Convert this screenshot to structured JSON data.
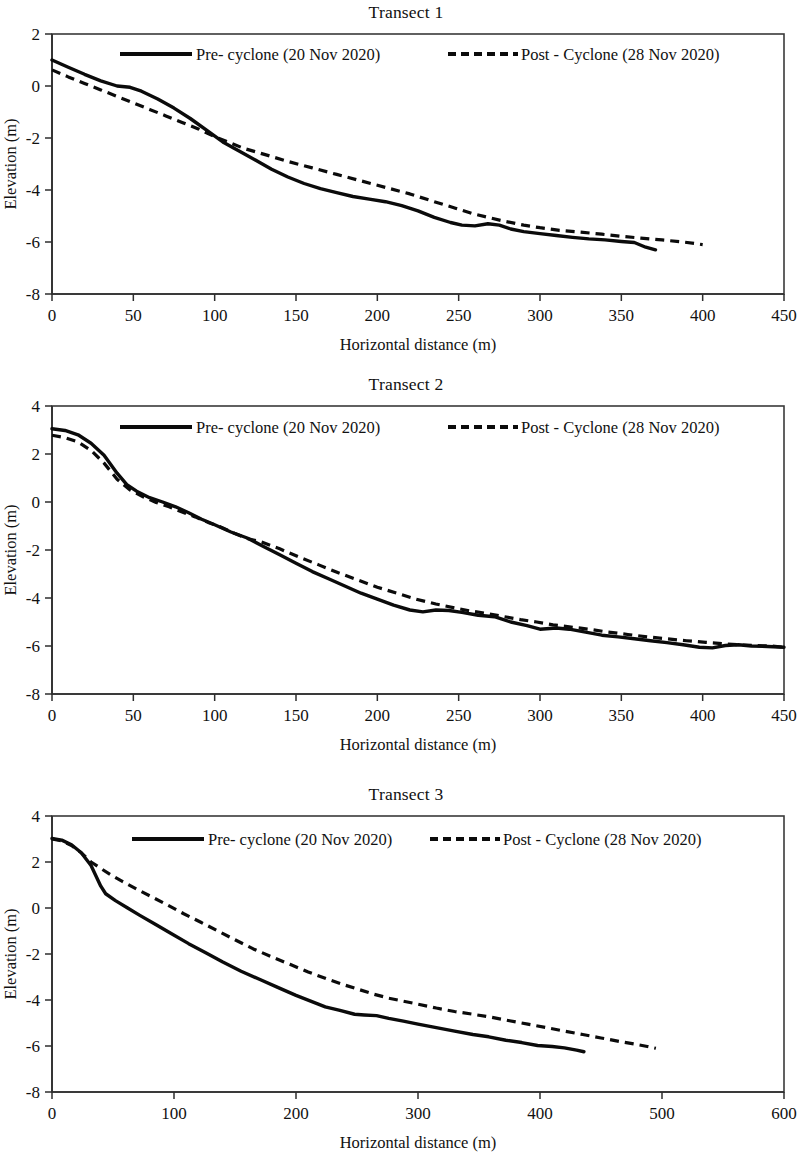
{
  "figure": {
    "panels": [
      "transect_1",
      "transect_2",
      "transect_3"
    ]
  },
  "legend": {
    "pre_label": "Pre- cyclone (20 Nov 2020)",
    "post_label": "Post - Cyclone (28 Nov 2020)"
  },
  "axis": {
    "xlabel": "Horizontal distance (m)",
    "ylabel": "Elevation (m)"
  },
  "titles": {
    "t1": "Transect 1",
    "t2": "Transect 2",
    "t3": "Transect 3"
  },
  "chart_data": [
    {
      "id": "transect_1",
      "type": "line",
      "title": "Transect 1",
      "xlabel": "Horizontal distance (m)",
      "ylabel": "Elevation (m)",
      "xlim": [
        0,
        450
      ],
      "ylim": [
        -8,
        2
      ],
      "xticks": [
        0,
        50,
        100,
        150,
        200,
        250,
        300,
        350,
        400,
        450
      ],
      "yticks": [
        2,
        0,
        -2,
        -4,
        -6,
        -8
      ],
      "grid": false,
      "legend_position": "top-inside",
      "series": [
        {
          "name": "Pre- cyclone (20 Nov 2020)",
          "style": "solid",
          "color": "#0b0b0b",
          "x": [
            0,
            10,
            20,
            30,
            40,
            48,
            55,
            65,
            75,
            85,
            95,
            105,
            115,
            125,
            135,
            145,
            155,
            165,
            175,
            185,
            195,
            205,
            215,
            225,
            235,
            245,
            252,
            260,
            268,
            275,
            282,
            290,
            300,
            310,
            320,
            330,
            340,
            350,
            358,
            365,
            371
          ],
          "y": [
            1.0,
            0.72,
            0.45,
            0.2,
            0.0,
            -0.05,
            -0.2,
            -0.5,
            -0.85,
            -1.25,
            -1.7,
            -2.15,
            -2.5,
            -2.85,
            -3.2,
            -3.5,
            -3.75,
            -3.95,
            -4.1,
            -4.25,
            -4.35,
            -4.45,
            -4.6,
            -4.8,
            -5.05,
            -5.25,
            -5.35,
            -5.38,
            -5.3,
            -5.35,
            -5.5,
            -5.6,
            -5.68,
            -5.75,
            -5.82,
            -5.88,
            -5.92,
            -5.98,
            -6.02,
            -6.2,
            -6.3
          ]
        },
        {
          "name": "Post - Cyclone (28 Nov 2020)",
          "style": "dashed",
          "color": "#0b0b0b",
          "x": [
            0,
            10,
            20,
            30,
            40,
            50,
            60,
            70,
            80,
            90,
            100,
            110,
            118,
            130,
            145,
            160,
            175,
            190,
            205,
            220,
            235,
            248,
            258,
            268,
            278,
            290,
            300,
            312,
            325,
            338,
            350,
            362,
            375,
            388,
            400
          ],
          "y": [
            0.62,
            0.35,
            0.1,
            -0.15,
            -0.4,
            -0.65,
            -0.9,
            -1.15,
            -1.4,
            -1.65,
            -1.95,
            -2.2,
            -2.4,
            -2.62,
            -2.9,
            -3.15,
            -3.4,
            -3.65,
            -3.9,
            -4.15,
            -4.45,
            -4.7,
            -4.9,
            -5.05,
            -5.2,
            -5.35,
            -5.45,
            -5.55,
            -5.62,
            -5.7,
            -5.78,
            -5.85,
            -5.92,
            -6.0,
            -6.1
          ]
        }
      ]
    },
    {
      "id": "transect_2",
      "type": "line",
      "title": "Transect 2",
      "xlabel": "Horizontal distance (m)",
      "ylabel": "Elevation (m)",
      "xlim": [
        0,
        450
      ],
      "ylim": [
        -8,
        4
      ],
      "xticks": [
        0,
        50,
        100,
        150,
        200,
        250,
        300,
        350,
        400,
        450
      ],
      "yticks": [
        4,
        2,
        0,
        -2,
        -4,
        -6,
        -8
      ],
      "grid": false,
      "legend_position": "top-inside",
      "series": [
        {
          "name": "Pre- cyclone (20 Nov 2020)",
          "style": "solid",
          "color": "#0b0b0b",
          "x": [
            0,
            8,
            16,
            24,
            32,
            40,
            46,
            52,
            60,
            68,
            76,
            84,
            92,
            100,
            110,
            120,
            130,
            140,
            150,
            160,
            170,
            180,
            190,
            200,
            210,
            220,
            228,
            236,
            244,
            252,
            262,
            272,
            282,
            292,
            300,
            310,
            318,
            328,
            338,
            348,
            358,
            368,
            378,
            388,
            398,
            406,
            414,
            422,
            430,
            440,
            450
          ],
          "y": [
            3.05,
            2.98,
            2.8,
            2.45,
            1.95,
            1.2,
            0.72,
            0.45,
            0.18,
            0.0,
            -0.2,
            -0.45,
            -0.72,
            -0.95,
            -1.25,
            -1.5,
            -1.85,
            -2.2,
            -2.55,
            -2.9,
            -3.2,
            -3.5,
            -3.8,
            -4.05,
            -4.3,
            -4.5,
            -4.58,
            -4.5,
            -4.52,
            -4.6,
            -4.72,
            -4.78,
            -5.0,
            -5.15,
            -5.3,
            -5.25,
            -5.3,
            -5.42,
            -5.55,
            -5.62,
            -5.7,
            -5.78,
            -5.86,
            -5.95,
            -6.05,
            -6.08,
            -5.98,
            -5.95,
            -6.0,
            -6.02,
            -6.05
          ]
        },
        {
          "name": "Post - Cyclone (28 Nov 2020)",
          "style": "dashed",
          "color": "#0b0b0b",
          "x": [
            0,
            8,
            16,
            24,
            32,
            40,
            48,
            56,
            64,
            72,
            80,
            88,
            96,
            104,
            112,
            120,
            128,
            140,
            152,
            164,
            176,
            188,
            200,
            212,
            224,
            236,
            248,
            258,
            268,
            278,
            288,
            298,
            308,
            318,
            330,
            342,
            354,
            366,
            378,
            390,
            402,
            412,
            422,
            432,
            442,
            450
          ],
          "y": [
            2.78,
            2.68,
            2.5,
            2.15,
            1.62,
            0.95,
            0.5,
            0.22,
            -0.02,
            -0.2,
            -0.42,
            -0.62,
            -0.85,
            -1.05,
            -1.3,
            -1.52,
            -1.65,
            -1.95,
            -2.3,
            -2.62,
            -2.95,
            -3.25,
            -3.55,
            -3.8,
            -4.05,
            -4.25,
            -4.42,
            -4.55,
            -4.65,
            -4.78,
            -4.9,
            -5.0,
            -5.12,
            -5.2,
            -5.3,
            -5.42,
            -5.52,
            -5.62,
            -5.7,
            -5.78,
            -5.85,
            -5.9,
            -5.95,
            -5.98,
            -6.0,
            -6.05
          ]
        }
      ]
    },
    {
      "id": "transect_3",
      "type": "line",
      "title": "Transect 3",
      "xlabel": "Horizontal distance (m)",
      "ylabel": "Elevation (m)",
      "xlim": [
        0,
        600
      ],
      "ylim": [
        -8,
        4
      ],
      "xticks": [
        0,
        100,
        200,
        300,
        400,
        500,
        600
      ],
      "yticks": [
        4,
        2,
        0,
        -2,
        -4,
        -6,
        -8
      ],
      "grid": false,
      "legend_position": "top-inside",
      "series": [
        {
          "name": "Pre- cyclone (20 Nov 2020)",
          "style": "solid",
          "color": "#0b0b0b",
          "x": [
            0,
            8,
            16,
            24,
            32,
            40,
            44,
            52,
            62,
            72,
            85,
            98,
            112,
            126,
            140,
            155,
            170,
            185,
            200,
            212,
            224,
            236,
            248,
            256,
            266,
            276,
            288,
            300,
            315,
            330,
            345,
            358,
            372,
            385,
            398,
            410,
            420,
            430,
            436
          ],
          "y": [
            3.02,
            2.95,
            2.75,
            2.4,
            1.85,
            0.95,
            0.62,
            0.32,
            0.0,
            -0.32,
            -0.72,
            -1.12,
            -1.55,
            -1.95,
            -2.35,
            -2.75,
            -3.1,
            -3.45,
            -3.8,
            -4.05,
            -4.3,
            -4.45,
            -4.62,
            -4.65,
            -4.68,
            -4.8,
            -4.92,
            -5.05,
            -5.2,
            -5.35,
            -5.5,
            -5.6,
            -5.75,
            -5.85,
            -5.98,
            -6.02,
            -6.08,
            -6.18,
            -6.25
          ]
        },
        {
          "name": "Post - Cyclone (28 Nov 2020)",
          "style": "dashed",
          "color": "#0b0b0b",
          "x": [
            0,
            8,
            16,
            24,
            32,
            40,
            48,
            58,
            70,
            82,
            95,
            108,
            122,
            136,
            150,
            165,
            180,
            195,
            210,
            225,
            240,
            252,
            264,
            276,
            288,
            300,
            315,
            330,
            345,
            360,
            375,
            390,
            405,
            420,
            435,
            450,
            465,
            478,
            488,
            495
          ],
          "y": [
            3.0,
            2.92,
            2.72,
            2.4,
            2.0,
            1.72,
            1.45,
            1.15,
            0.8,
            0.48,
            0.12,
            -0.25,
            -0.62,
            -1.0,
            -1.38,
            -1.78,
            -2.12,
            -2.45,
            -2.78,
            -3.08,
            -3.35,
            -3.55,
            -3.75,
            -3.92,
            -4.05,
            -4.18,
            -4.35,
            -4.5,
            -4.62,
            -4.75,
            -4.9,
            -5.05,
            -5.2,
            -5.35,
            -5.5,
            -5.65,
            -5.8,
            -5.92,
            -6.02,
            -6.1
          ]
        }
      ]
    }
  ]
}
